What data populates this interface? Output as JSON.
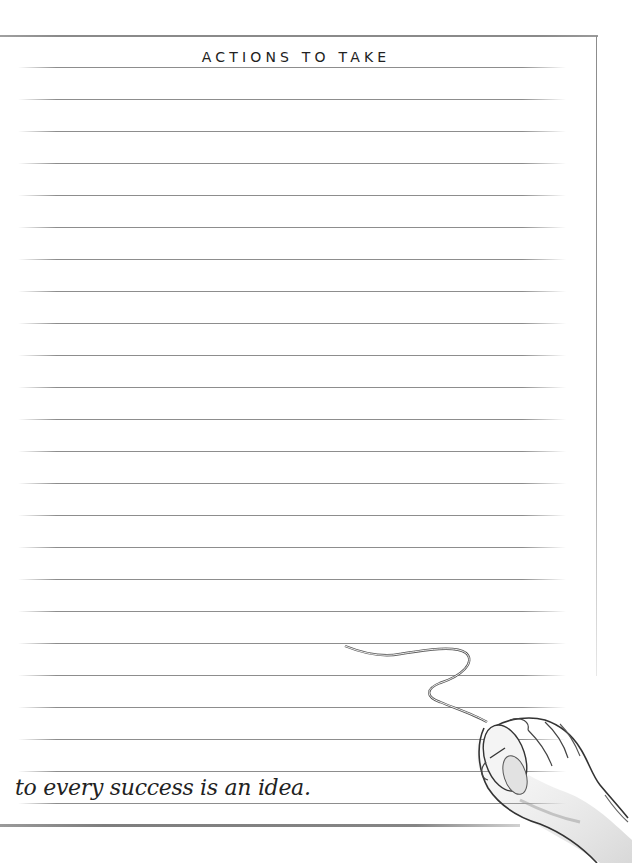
{
  "page": {
    "title": "ACTIONS TO TAKE",
    "ruled_line_count": 24,
    "tagline": "to every success is an idea.",
    "illustration": "hand-on-computer-mouse-icon",
    "colors": {
      "background": "#ffffff",
      "rule": "#8d8d8d",
      "border": "#8a8a8a",
      "text": "#222222"
    }
  }
}
